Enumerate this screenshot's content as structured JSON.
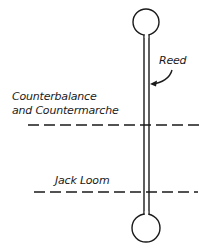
{
  "diagram": {
    "labels": {
      "reed": "Reed",
      "counterbalance_line1": "Counterbalance",
      "counterbalance_line2": "and Countermarche",
      "jack_loom": "Jack Loom"
    },
    "colors": {
      "ink": "#1a1a1a",
      "background": "#ffffff"
    }
  }
}
